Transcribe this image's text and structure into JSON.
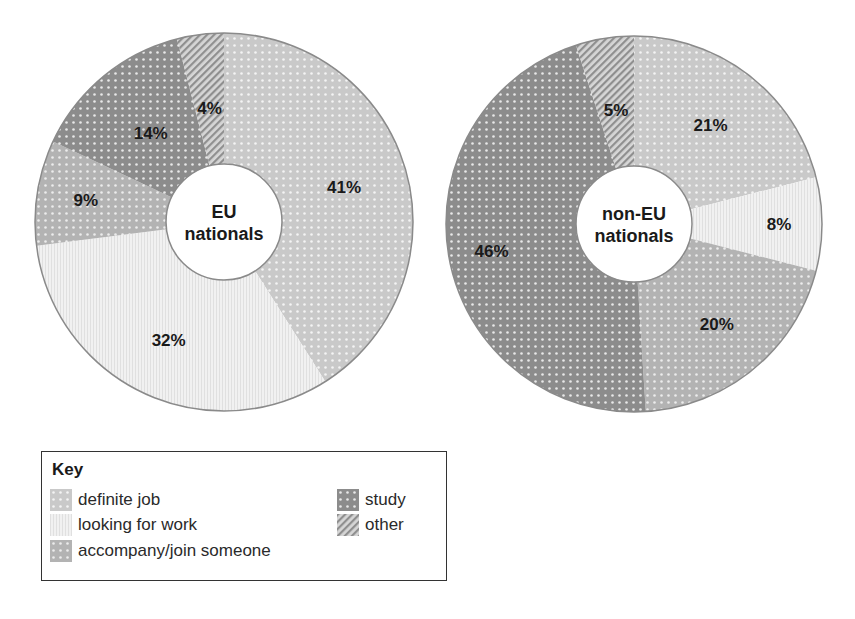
{
  "chart_data": [
    {
      "type": "pie",
      "title": "EU nationals",
      "center_label": [
        "EU",
        "nationals"
      ],
      "start_angle": "top, clockwise",
      "categories": [
        "definite job",
        "looking for work",
        "accompany/join someone",
        "study",
        "other"
      ],
      "values": [
        41,
        32,
        9,
        14,
        4
      ],
      "labels": [
        "41%",
        "32%",
        "9%",
        "14%",
        "4%"
      ]
    },
    {
      "type": "pie",
      "title": "non-EU nationals",
      "center_label": [
        "non-EU",
        "nationals"
      ],
      "start_angle": "top, clockwise",
      "categories": [
        "definite job",
        "looking for work",
        "accompany/join someone",
        "study",
        "other"
      ],
      "values": [
        21,
        8,
        20,
        46,
        5
      ],
      "labels": [
        "21%",
        "8%",
        "20%",
        "46%",
        "5%"
      ]
    }
  ],
  "legend": {
    "title": "Key",
    "items": [
      {
        "label": "definite job",
        "pattern": "light-dots",
        "color": "#c9c9c9"
      },
      {
        "label": "looking for work",
        "pattern": "vertical-lines",
        "color": "#eeeeee"
      },
      {
        "label": "accompany/join someone",
        "pattern": "medium-dots",
        "color": "#b3b3b3"
      },
      {
        "label": "study",
        "pattern": "dark-dots",
        "color": "#8c8c8c"
      },
      {
        "label": "other",
        "pattern": "hatched",
        "color": "#a8a8a8"
      }
    ]
  },
  "charts": {
    "eu": {
      "center_line1": "EU",
      "center_line2": "nationals"
    },
    "noneu": {
      "center_line1": "non-EU",
      "center_line2": "nationals"
    }
  }
}
